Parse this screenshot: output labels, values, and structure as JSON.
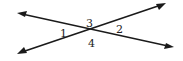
{
  "figure": {
    "lines": [
      {
        "name": "line-a",
        "direction": "upper-left to lower-right",
        "arrows_both_ends": true
      },
      {
        "name": "line-b",
        "direction": "lower-left to upper-right",
        "arrows_both_ends": true
      }
    ],
    "angle_labels": [
      {
        "id": "1",
        "position": "left"
      },
      {
        "id": "2",
        "position": "right"
      },
      {
        "id": "3",
        "position": "top"
      },
      {
        "id": "4",
        "position": "bottom"
      }
    ],
    "colors": {
      "stroke": "#1a1a1a",
      "text": "#222222",
      "background": "#ffffff"
    }
  }
}
